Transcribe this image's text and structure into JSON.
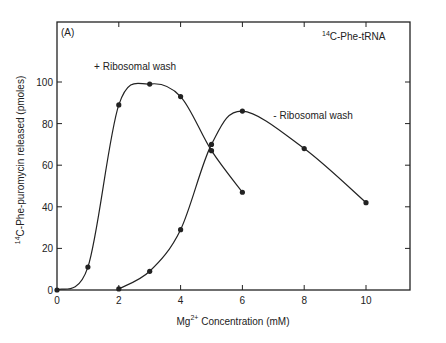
{
  "chart_data": {
    "type": "line",
    "panel_label": "(A)",
    "title": "",
    "annotation": {
      "sup": "14",
      "text": "C-Phe-tRNA"
    },
    "xlabel": {
      "prefix": "Mg",
      "sup": "2+",
      "text": " Concentration (mM)"
    },
    "ylabel": {
      "sup": "14",
      "text": "C-Phe-puromycin released (pmoles)"
    },
    "xlim": [
      0,
      12
    ],
    "ylim": [
      0,
      120
    ],
    "x_ticks": [
      0,
      2,
      4,
      6,
      8,
      10
    ],
    "x_tick_labels": [
      "0",
      "2",
      "4",
      "6",
      "8",
      "10"
    ],
    "y_ticks": [
      0,
      20,
      40,
      60,
      80,
      100
    ],
    "y_tick_labels": [
      "0",
      "20",
      "40",
      "60",
      "80",
      "100"
    ],
    "grid": false,
    "series": [
      {
        "name": "+ Ribosomal wash",
        "x": [
          0,
          1,
          2,
          3,
          4,
          5,
          6
        ],
        "values": [
          0,
          11,
          89,
          99,
          93,
          67,
          47
        ],
        "label_pos": {
          "x": 1.2,
          "y": 106
        }
      },
      {
        "name": "- Ribosomal wash",
        "x": [
          2,
          3,
          4,
          5,
          6,
          8,
          10
        ],
        "values": [
          0.5,
          9,
          29,
          70,
          86,
          68,
          42
        ],
        "label_pos": {
          "x": 7.0,
          "y": 82
        }
      }
    ],
    "line_color": "#222222"
  }
}
